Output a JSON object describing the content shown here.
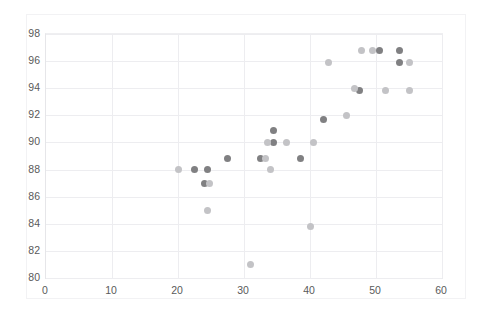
{
  "chart": {
    "title": "",
    "background": "#ffffff",
    "axis_color": "#e6e6e9",
    "grid_color": "#ededf0",
    "tick_text_color": "#5a5a5a"
  },
  "chart_data": {
    "type": "scatter",
    "title": "",
    "subtitle": "",
    "xlabel": "",
    "ylabel": "",
    "xlim": [
      0,
      60
    ],
    "ylim": [
      80,
      98
    ],
    "xticks": [
      0,
      10,
      20,
      30,
      40,
      50,
      60
    ],
    "yticks": [
      80,
      82,
      84,
      86,
      88,
      90,
      92,
      94,
      96,
      98
    ],
    "grid": true,
    "legend": "none",
    "marker": {
      "shape": "circle",
      "size_px": 7
    },
    "series": [
      {
        "name": "series-1",
        "color": "#808082",
        "points": [
          {
            "x": 22.5,
            "y": 88.0
          },
          {
            "x": 24.5,
            "y": 88.0
          },
          {
            "x": 24.0,
            "y": 87.0
          },
          {
            "x": 27.5,
            "y": 88.8
          },
          {
            "x": 32.5,
            "y": 88.8
          },
          {
            "x": 34.5,
            "y": 90.9
          },
          {
            "x": 34.5,
            "y": 90.0
          },
          {
            "x": 38.5,
            "y": 88.8
          },
          {
            "x": 42.0,
            "y": 91.7
          },
          {
            "x": 47.5,
            "y": 93.8
          },
          {
            "x": 50.5,
            "y": 96.8
          },
          {
            "x": 53.5,
            "y": 96.8
          },
          {
            "x": 53.5,
            "y": 95.9
          }
        ]
      },
      {
        "name": "series-2",
        "color": "#c3c3c6",
        "points": [
          {
            "x": 20.0,
            "y": 88.0
          },
          {
            "x": 24.8,
            "y": 87.0
          },
          {
            "x": 24.5,
            "y": 85.0
          },
          {
            "x": 31.0,
            "y": 81.0
          },
          {
            "x": 33.2,
            "y": 88.8
          },
          {
            "x": 33.5,
            "y": 90.0
          },
          {
            "x": 34.0,
            "y": 88.0
          },
          {
            "x": 36.5,
            "y": 90.0
          },
          {
            "x": 40.0,
            "y": 83.8
          },
          {
            "x": 40.5,
            "y": 90.0
          },
          {
            "x": 42.8,
            "y": 95.9
          },
          {
            "x": 45.5,
            "y": 92.0
          },
          {
            "x": 46.8,
            "y": 94.0
          },
          {
            "x": 47.8,
            "y": 96.8
          },
          {
            "x": 49.5,
            "y": 96.8
          },
          {
            "x": 51.5,
            "y": 93.8
          },
          {
            "x": 55.0,
            "y": 95.9
          },
          {
            "x": 55.0,
            "y": 93.8
          }
        ]
      }
    ]
  }
}
